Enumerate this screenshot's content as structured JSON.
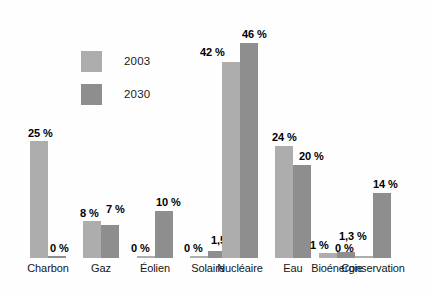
{
  "chart_data": {
    "type": "bar",
    "title": "",
    "subtitle": "",
    "xlabel": "",
    "ylabel": "",
    "ylim": [
      0,
      50
    ],
    "grid": false,
    "legend_position": "top-left",
    "categories": [
      "Charbon",
      "Gaz",
      "Éolien",
      "Solaire",
      "Nucléaire",
      "Eau",
      "Bioénergie",
      "Conservation"
    ],
    "series": [
      {
        "name": "2003",
        "color": "#adadad",
        "values": [
          25,
          8,
          0,
          0,
          42,
          24,
          1,
          0
        ],
        "labels": [
          "25 %",
          "8 %",
          "0 %",
          "0 %",
          "42 %",
          "24 %",
          "1 %",
          "0 %"
        ]
      },
      {
        "name": "2030",
        "color": "#8e8e8e",
        "values": [
          0,
          7,
          10,
          1.5,
          46,
          20,
          1.3,
          14
        ],
        "labels": [
          "0 %",
          "7 %",
          "10 %",
          "1,5 %",
          "46 %",
          "20 %",
          "1,3 %",
          "14 %"
        ]
      }
    ]
  },
  "legend": {
    "items": [
      {
        "label": "2003",
        "color": "#adadad"
      },
      {
        "label": "2030",
        "color": "#8e8e8e"
      }
    ]
  },
  "axis": {
    "categories": [
      {
        "label": "Charbon"
      },
      {
        "label": "Gaz"
      },
      {
        "label": "Éolien"
      },
      {
        "label": "Solaire"
      },
      {
        "label": "Nucléaire"
      },
      {
        "label": "Eau"
      },
      {
        "label": "Bioénergie"
      },
      {
        "label": "Conservation"
      }
    ]
  }
}
